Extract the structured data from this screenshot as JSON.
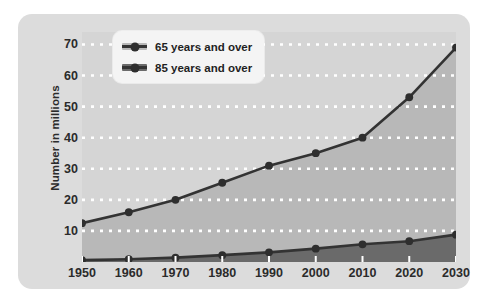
{
  "chart_data": {
    "type": "area",
    "title": "",
    "xlabel": "",
    "ylabel": "Number in millions",
    "categories": [
      1950,
      1960,
      1970,
      1980,
      1990,
      2000,
      2010,
      2020,
      2030
    ],
    "xtick_labels": [
      "1950",
      "1960",
      "1970",
      "1980",
      "1990",
      "2000",
      "2010",
      "2020",
      "2030"
    ],
    "ytick_labels": [
      "10",
      "20",
      "30",
      "40",
      "50",
      "60",
      "70"
    ],
    "yticks": [
      10,
      20,
      30,
      40,
      50,
      60,
      70
    ],
    "ylim": [
      0,
      74
    ],
    "xlim": [
      1950,
      2030
    ],
    "grid": "horizontal-dotted-white",
    "legend_position": "top-left-inside",
    "series": [
      {
        "name": "65 years and over",
        "values": [
          12.5,
          16.0,
          20.0,
          25.5,
          31.0,
          35.0,
          40.0,
          53.0,
          69.0
        ],
        "line_color": "#333333",
        "fill_color": "#b8b8b8",
        "marker": "circle"
      },
      {
        "name": "85 years and over",
        "values": [
          0.6,
          0.9,
          1.4,
          2.2,
          3.1,
          4.3,
          5.7,
          6.7,
          8.8
        ],
        "line_color": "#333333",
        "fill_color": "#6a6a6a",
        "marker": "circle"
      }
    ]
  },
  "legend": {
    "items": [
      {
        "label": "65 years and over",
        "swatch_color": "#b8b8b8"
      },
      {
        "label": "85 years and over",
        "swatch_color": "#6a6a6a"
      }
    ]
  },
  "colors": {
    "page_background": "#ffffff",
    "panel_background": "#dcdcdc",
    "plot_upper_background": "#d5d5d5",
    "band_65_fill": "#b8b8b8",
    "band_85_fill": "#6a6a6a",
    "line": "#333333",
    "marker": "#2e2e2e",
    "gridline": "#ffffff",
    "text": "#2b2b2b"
  }
}
